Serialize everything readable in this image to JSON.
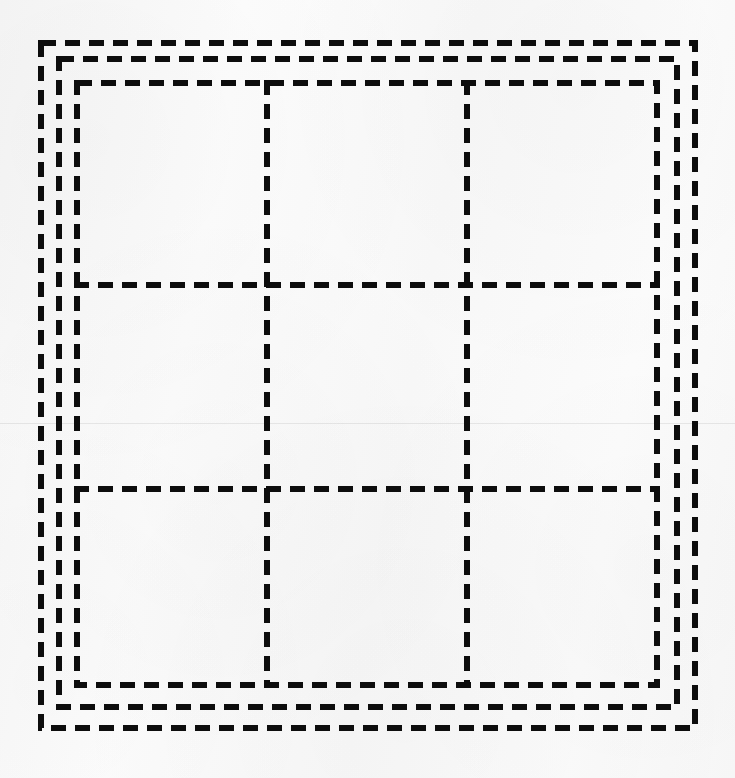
{
  "figure": {
    "kind": "line-diagram",
    "canvas": {
      "width": 735,
      "height": 778
    },
    "background": {
      "color": "#fbfbfb",
      "texture": "scanned-paper",
      "artifacts": [
        {
          "name": "horizontal-scan-seam",
          "y": 423,
          "color": "rgba(0,0,0,0.075)"
        }
      ]
    },
    "stroke": {
      "color": "#0d0d0d",
      "width": 6,
      "dash_length": 15,
      "gap_length": 9,
      "linecap": "butt"
    },
    "rectangles": [
      {
        "name": "outer-dashed-square",
        "index": 1,
        "label": "outer",
        "x": 38,
        "y": 40,
        "width": 660,
        "height": 691,
        "x2": 698,
        "y2": 731
      },
      {
        "name": "middle-dashed-square",
        "index": 2,
        "label": "middle",
        "x": 56,
        "y": 56,
        "width": 624,
        "height": 654,
        "x2": 680,
        "y2": 710
      },
      {
        "name": "inner-dashed-square",
        "index": 3,
        "label": "inner",
        "x": 74,
        "y": 80,
        "width": 586,
        "height": 608,
        "x2": 660,
        "y2": 688
      }
    ],
    "grid": {
      "name": "inner-3x3-grid",
      "rows": 3,
      "columns": 3,
      "cells": 9,
      "bounds": {
        "x1": 74,
        "y1": 80,
        "x2": 660,
        "y2": 688
      },
      "vertical_lines_x": [
        267,
        467
      ],
      "horizontal_lines_y": [
        285,
        489
      ],
      "cell_labels": [
        [
          "r1c1",
          "r1c2",
          "r1c3"
        ],
        [
          "r2c1",
          "r2c2",
          "r2c3"
        ],
        [
          "r3c1",
          "r3c2",
          "r3c3"
        ]
      ]
    }
  }
}
